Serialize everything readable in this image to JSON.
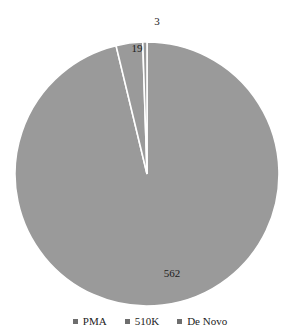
{
  "chart_data": {
    "type": "pie",
    "title": "",
    "categories": [
      "PMA",
      "510K",
      "De Novo"
    ],
    "values": [
      562,
      19,
      3
    ],
    "labels": [
      "562",
      "19",
      "3"
    ],
    "total": 584,
    "percentages": [
      96.2,
      3.3,
      0.5
    ],
    "colors": [
      "#9a9a9a",
      "#9a9a9a",
      "#9a9a9a"
    ],
    "start_angle_deg": 90,
    "direction": "counterclockwise",
    "legend_position": "bottom",
    "grid": false,
    "xlabel": "",
    "ylabel": ""
  },
  "legend": {
    "entries": [
      {
        "label": "PMA",
        "color": "#6e6e6e",
        "marker": "square-marker"
      },
      {
        "label": "510K",
        "color": "#6e6e6e",
        "marker": "square-marker"
      },
      {
        "label": "De Novo",
        "color": "#6e6e6e",
        "marker": "square-marker"
      }
    ]
  },
  "geometry": {
    "center_x": 147,
    "center_y": 174,
    "radius": 132,
    "label_positions": [
      {
        "x": 172,
        "y": 273
      },
      {
        "x": 137,
        "y": 48
      },
      {
        "x": 157,
        "y": 21
      }
    ]
  }
}
